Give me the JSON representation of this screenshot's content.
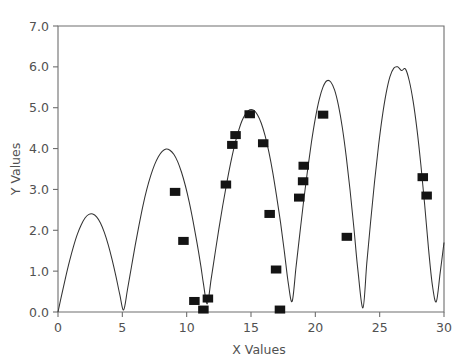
{
  "chart_data": {
    "type": "scatter",
    "title": "",
    "xlabel": "X Values",
    "ylabel": "Y Values",
    "xlim": [
      0,
      30
    ],
    "ylim": [
      0,
      7
    ],
    "xticks": [
      0,
      5,
      10,
      15,
      20,
      25,
      30
    ],
    "yticks": [
      0.0,
      1.0,
      2.0,
      3.0,
      4.0,
      5.0,
      6.0,
      7.0
    ],
    "xtick_labels": [
      "0",
      "5",
      "10",
      "15",
      "20",
      "25",
      "30"
    ],
    "ytick_labels": [
      "0.0",
      "1.0",
      "2.0",
      "3.0",
      "4.0",
      "5.0",
      "6.0",
      "7.0"
    ],
    "grid": false,
    "legend": false,
    "marker_style": "filled-square",
    "marker_color": "#141414",
    "line_color": "#333333",
    "axis_color": "#6e6e6e",
    "series": [
      {
        "name": "fitted curve",
        "type": "line",
        "x": [
          0.0,
          0.3,
          0.6,
          0.9,
          1.2,
          1.5,
          1.8,
          2.1,
          2.4,
          2.7,
          3.0,
          3.3,
          3.6,
          3.9,
          4.2,
          4.5,
          4.8,
          5.1,
          5.4,
          5.7,
          6.0,
          6.3,
          6.6,
          6.9,
          7.2,
          7.5,
          7.8,
          8.1,
          8.4,
          8.7,
          9.0,
          9.3,
          9.6,
          9.9,
          10.2,
          10.5,
          10.8,
          11.1,
          11.3,
          11.6,
          11.9,
          12.2,
          12.5,
          12.8,
          13.1,
          13.4,
          13.7,
          14.0,
          14.3,
          14.6,
          14.9,
          15.2,
          15.5,
          15.8,
          16.1,
          16.4,
          16.7,
          17.0,
          17.3,
          17.6,
          17.9,
          18.2,
          18.5,
          18.8,
          19.1,
          19.4,
          19.7,
          20.0,
          20.3,
          20.6,
          20.9,
          21.2,
          21.5,
          21.8,
          22.1,
          22.4,
          22.7,
          23.0,
          23.3,
          23.7,
          24.0,
          24.3,
          24.6,
          24.9,
          25.2,
          25.5,
          25.8,
          26.1,
          26.4,
          26.7,
          27.0,
          27.3,
          27.6,
          27.9,
          28.2,
          28.5,
          28.8,
          29.1,
          29.4,
          29.7,
          30.0
        ],
        "y": [
          0.0,
          0.44,
          0.86,
          1.25,
          1.6,
          1.9,
          2.13,
          2.3,
          2.39,
          2.4,
          2.33,
          2.18,
          1.95,
          1.65,
          1.29,
          0.88,
          0.43,
          0.05,
          0.55,
          1.09,
          1.63,
          2.13,
          2.6,
          3.0,
          3.33,
          3.6,
          3.8,
          3.93,
          3.99,
          3.96,
          3.86,
          3.68,
          3.42,
          3.09,
          2.69,
          2.22,
          1.7,
          1.13,
          0.7,
          0.2,
          0.8,
          1.42,
          2.03,
          2.6,
          3.13,
          3.62,
          4.05,
          4.4,
          4.68,
          4.86,
          4.95,
          4.94,
          4.83,
          4.62,
          4.31,
          3.9,
          3.4,
          2.81,
          2.18,
          1.46,
          0.7,
          0.26,
          1.1,
          1.93,
          2.74,
          3.48,
          4.16,
          4.74,
          5.2,
          5.51,
          5.66,
          5.63,
          5.43,
          5.05,
          4.51,
          3.81,
          2.98,
          2.05,
          1.05,
          0.1,
          1.2,
          2.22,
          3.18,
          4.04,
          4.77,
          5.35,
          5.76,
          5.97,
          6.0,
          5.91,
          5.95,
          5.66,
          5.16,
          4.47,
          3.61,
          2.62,
          1.54,
          0.65,
          0.25,
          0.95,
          1.7
        ]
      },
      {
        "name": "measured points",
        "type": "scatter",
        "points": [
          {
            "x": 9.1,
            "y": 2.94
          },
          {
            "x": 9.75,
            "y": 1.74
          },
          {
            "x": 10.6,
            "y": 0.27
          },
          {
            "x": 11.3,
            "y": 0.06
          },
          {
            "x": 11.65,
            "y": 0.33
          },
          {
            "x": 13.05,
            "y": 3.12
          },
          {
            "x": 13.55,
            "y": 4.09
          },
          {
            "x": 13.8,
            "y": 4.33
          },
          {
            "x": 14.9,
            "y": 4.84
          },
          {
            "x": 15.95,
            "y": 4.13
          },
          {
            "x": 16.45,
            "y": 2.4
          },
          {
            "x": 16.95,
            "y": 1.04
          },
          {
            "x": 17.25,
            "y": 0.06
          },
          {
            "x": 18.75,
            "y": 2.8
          },
          {
            "x": 19.05,
            "y": 3.2
          },
          {
            "x": 19.1,
            "y": 3.58
          },
          {
            "x": 20.6,
            "y": 4.83
          },
          {
            "x": 22.45,
            "y": 1.84
          },
          {
            "x": 28.35,
            "y": 3.3
          },
          {
            "x": 28.65,
            "y": 2.85
          }
        ]
      }
    ]
  },
  "figure": {
    "background_color": "#ffffff",
    "plot_area": {
      "left": 58,
      "top": 26,
      "right": 444,
      "bottom": 312
    }
  }
}
